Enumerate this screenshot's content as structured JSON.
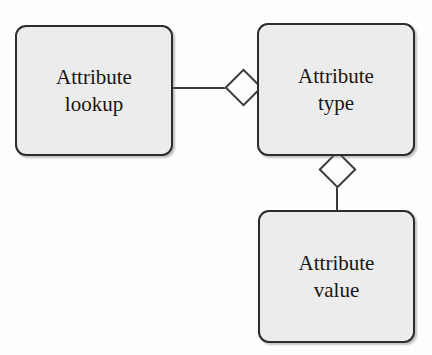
{
  "diagram": {
    "type": "entity-relationship",
    "title_fragment": "",
    "nodes": [
      {
        "id": "attribute-lookup",
        "line1": "Attribute",
        "line2": "lookup",
        "x": 15,
        "y": 25,
        "width": 158,
        "height": 131
      },
      {
        "id": "attribute-type",
        "line1": "Attribute",
        "line2": "type",
        "x": 257,
        "y": 23,
        "width": 158,
        "height": 133
      },
      {
        "id": "attribute-value",
        "line1": "Attribute",
        "line2": "value",
        "x": 258,
        "y": 210,
        "width": 157,
        "height": 133
      }
    ],
    "connectors": [
      {
        "id": "lookup-type",
        "from": "attribute-lookup",
        "to": "attribute-type",
        "marker": "hollow-diamond",
        "marker_at": "attribute-type",
        "orientation": "horizontal"
      },
      {
        "id": "type-value",
        "from": "attribute-type",
        "to": "attribute-value",
        "marker": "hollow-diamond",
        "marker_at": "attribute-type",
        "orientation": "vertical"
      }
    ],
    "colors": {
      "background": "#fdfdfd",
      "node_fill": "#ececec",
      "node_border": "#2c2c2c",
      "line": "#3a3a3a",
      "diamond_fill": "#fdfdfd",
      "text": "#171717"
    }
  }
}
